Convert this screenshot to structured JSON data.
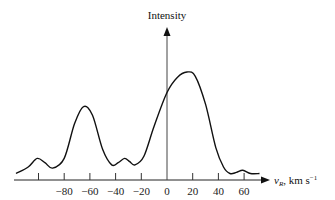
{
  "chart_data": {
    "type": "line",
    "title": "",
    "xlabel": "v_R, km s^-1",
    "xlabel_parts": {
      "var": "v",
      "sub": "R",
      "unit": ", km s",
      "sup": "−1"
    },
    "ylabel": "Intensity",
    "xlim": [
      -118,
      72
    ],
    "ylim": [
      0,
      1.55
    ],
    "grid": false,
    "legend": null,
    "x_ticks": [
      -100,
      -80,
      -60,
      -40,
      -20,
      0,
      20,
      40,
      60
    ],
    "x_tick_labels": [
      "",
      "−80",
      "−60",
      "−40",
      "−20",
      "0",
      "20",
      "40",
      "60"
    ],
    "series": [
      {
        "name": "Intensity profile",
        "x": [
          -117.5,
          -108,
          -101,
          -95,
          -89,
          -80,
          -72,
          -65,
          -58,
          -50,
          -43,
          -38,
          -33,
          -29,
          -25,
          -18,
          -10,
          0,
          8,
          15.6,
          22,
          30,
          38,
          44,
          49,
          54,
          59,
          65,
          72
        ],
        "y": [
          0.06,
          0.12,
          0.2,
          0.16,
          0.11,
          0.2,
          0.52,
          0.68,
          0.6,
          0.28,
          0.14,
          0.16,
          0.2,
          0.17,
          0.14,
          0.22,
          0.5,
          0.81,
          0.95,
          1.0,
          0.96,
          0.7,
          0.3,
          0.12,
          0.06,
          0.07,
          0.09,
          0.06,
          0.06
        ]
      }
    ]
  },
  "labels": {
    "y_axis": "Intensity",
    "x_axis_var": "v",
    "x_axis_sub": "R",
    "x_axis_unit": ", km s",
    "x_axis_sup": "−1"
  }
}
